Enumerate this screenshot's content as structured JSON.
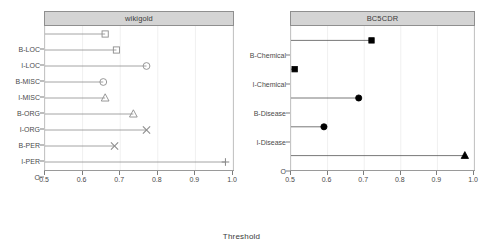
{
  "chart_data": {
    "type": "scatter",
    "title": "",
    "xlabel": "Threshold",
    "ylabel": "",
    "xlim": [
      0.5,
      1.0
    ],
    "xticks": [
      0.5,
      0.6,
      0.7,
      0.8,
      0.9,
      1.0
    ],
    "xticklabels": [
      "0.5",
      "0.6",
      "0.7",
      "0.8",
      "0.9",
      "1.0"
    ],
    "grid": true,
    "legend": "none",
    "panels": [
      {
        "title": "wikigold",
        "marker_style": "open",
        "categories": [
          "B-LOC",
          "I-LOC",
          "B-MISC",
          "I-MISC",
          "B-ORG",
          "I-ORG",
          "B-PER",
          "I-PER",
          "O"
        ],
        "values": [
          0.66,
          0.69,
          0.77,
          0.655,
          0.66,
          0.735,
          0.77,
          0.685,
          0.98
        ],
        "markers": [
          "square",
          "square",
          "circle",
          "circle",
          "triangle",
          "triangle",
          "cross",
          "cross",
          "plus"
        ]
      },
      {
        "title": "BC5CDR",
        "marker_style": "filled",
        "categories": [
          "B-Chemical",
          "I-Chemical",
          "B-Disease",
          "I-Disease",
          "O"
        ],
        "values": [
          0.72,
          0.51,
          0.685,
          0.59,
          0.975
        ],
        "markers": [
          "square",
          "square",
          "circle",
          "circle",
          "triangle"
        ]
      }
    ]
  },
  "colors": {
    "open_marker": "#8d8d8d",
    "filled_marker": "#000000",
    "line": "#8d8d8d",
    "strip_background": "#d4d4d4",
    "strip_border": "#8f8f8f",
    "axis": "#9a9a9a",
    "text": "#4a4a4a"
  }
}
